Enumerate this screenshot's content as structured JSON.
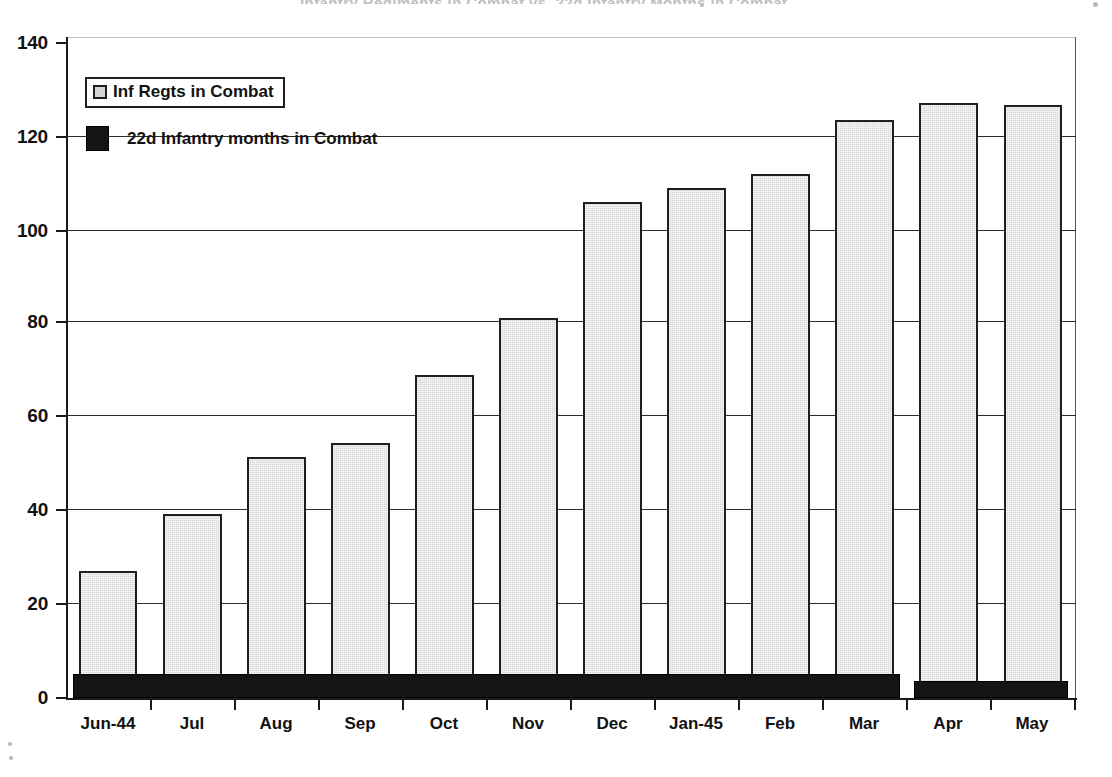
{
  "figure": {
    "title_remnant": "Infantry Regiments in Combat vs. 22d Infantry Months in Combat"
  },
  "legend": {
    "position": "upper-left-inside-plot",
    "items": [
      {
        "label": "Inf Regts in Combat",
        "swatch": "light-gray-square",
        "color": "#d6d6d6",
        "boxed": true
      },
      {
        "label": "22d Infantry months in Combat",
        "swatch": "black-square",
        "color": "#141414",
        "boxed": false
      }
    ]
  },
  "axes": {
    "y_ticks": [
      "0",
      "20",
      "40",
      "60",
      "80",
      "100",
      "120",
      "140"
    ],
    "x_ticks": [
      "Jun-44",
      "Jul",
      "Aug",
      "Sep",
      "Oct",
      "Nov",
      "Dec",
      "Jan-45",
      "Feb",
      "Mar",
      "Apr",
      "May"
    ]
  },
  "chart_data": {
    "type": "bar",
    "title": "Infantry Regiments in Combat vs. 22d Infantry Months in Combat",
    "xlabel": "",
    "ylabel": "",
    "ylim": [
      0,
      140
    ],
    "ytick_step": 20,
    "grid": true,
    "legend_position": "upper left",
    "categories": [
      "Jun-44",
      "Jul",
      "Aug",
      "Sep",
      "Oct",
      "Nov",
      "Dec",
      "Jan-45",
      "Feb",
      "Mar",
      "Apr",
      "May"
    ],
    "series": [
      {
        "name": "Inf Regts in Combat",
        "color": "#d6d6d6",
        "values": [
          27,
          39,
          51,
          54,
          68.5,
          80.5,
          105,
          108,
          111,
          122.5,
          126,
          125.5
        ]
      },
      {
        "name": "22d Infantry months in Combat",
        "color": "#141414",
        "values": [
          5,
          5,
          5,
          5,
          5,
          5,
          5,
          5,
          5,
          5,
          3.5,
          3.5
        ]
      }
    ]
  }
}
